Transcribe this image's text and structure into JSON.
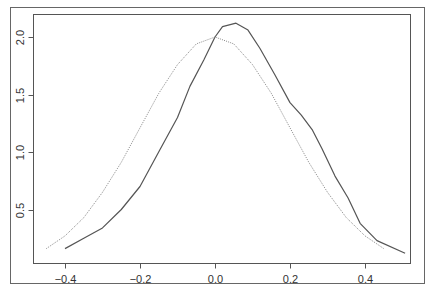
{
  "chart_data": {
    "type": "line",
    "title": "",
    "xlabel": "",
    "ylabel": "",
    "xlim": [
      -0.5,
      0.52
    ],
    "ylim": [
      0.05,
      2.2
    ],
    "grid": false,
    "legend": null,
    "x_ticks": [
      -0.4,
      -0.2,
      0.0,
      0.2,
      0.4
    ],
    "x_tick_labels": [
      "-0.4",
      "-0.2",
      "0.0",
      "0.2",
      "0.4"
    ],
    "y_ticks": [
      0.5,
      1.0,
      1.5,
      2.0
    ],
    "y_tick_labels": [
      "0.5",
      "1.0",
      "1.5",
      "2.0"
    ],
    "series": [
      {
        "name": "empirical density (solid)",
        "style": "solid",
        "color": "#555555",
        "x": [
          -0.4,
          -0.35,
          -0.3,
          -0.25,
          -0.2,
          -0.147,
          -0.1,
          -0.067,
          -0.03,
          0.0,
          0.02,
          0.056,
          0.088,
          0.12,
          0.16,
          0.2,
          0.23,
          0.26,
          0.285,
          0.32,
          0.355,
          0.387,
          0.432,
          0.507
        ],
        "y": [
          0.16,
          0.25,
          0.34,
          0.5,
          0.7,
          1.02,
          1.3,
          1.57,
          1.8,
          2.0,
          2.09,
          2.12,
          2.06,
          1.9,
          1.67,
          1.43,
          1.32,
          1.19,
          1.03,
          0.79,
          0.6,
          0.38,
          0.23,
          0.12
        ]
      },
      {
        "name": "normal density (dotted)",
        "style": "dotted",
        "color": "#888888",
        "x": [
          -0.45,
          -0.4,
          -0.35,
          -0.3,
          -0.25,
          -0.2,
          -0.15,
          -0.1,
          -0.05,
          0.0,
          0.05,
          0.1,
          0.15,
          0.2,
          0.25,
          0.3,
          0.35,
          0.4,
          0.45
        ],
        "y": [
          0.16,
          0.27,
          0.43,
          0.65,
          0.91,
          1.21,
          1.51,
          1.76,
          1.94,
          2.0,
          1.94,
          1.76,
          1.51,
          1.21,
          0.91,
          0.65,
          0.43,
          0.27,
          0.16
        ]
      }
    ]
  },
  "layout": {
    "outer_frame": {
      "x": 10,
      "y": 7,
      "w": 414,
      "h": 276
    },
    "plot_box": {
      "x": 33,
      "y": 14,
      "w": 377,
      "h": 249
    },
    "x_origin_px": 215,
    "x_scale_px": 375,
    "y_origin_px": 267,
    "y_scale_px": 115
  }
}
